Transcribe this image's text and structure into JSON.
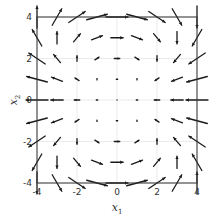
{
  "chart_data": {
    "type": "quiver",
    "title": "",
    "xlabel": "x",
    "xlabel_sub": "1",
    "ylabel": "x",
    "ylabel_sub": "2",
    "xlim": [
      -4,
      4
    ],
    "ylim": [
      -4,
      4
    ],
    "xticks": [
      -4,
      -2,
      0,
      2,
      4
    ],
    "yticks": [
      -4,
      -2,
      0,
      2,
      4
    ],
    "xtick_labels": [
      "-4",
      "-2",
      "0",
      "2",
      "4"
    ],
    "ytick_labels": [
      "-4",
      "-2",
      "0",
      "2",
      "4"
    ],
    "grid": true,
    "grid_points_x": [
      -4,
      -3,
      -2,
      -1,
      0,
      1,
      2,
      3,
      4
    ],
    "grid_points_y": [
      -4,
      -3,
      -2,
      -1,
      0,
      1,
      2,
      3,
      4
    ],
    "field": {
      "u": "x2^2 - x1^2",
      "v": "-x1*x2"
    },
    "arrow_color": "#1a1a1a",
    "grid_color": "#e6e6e6",
    "frame_color": "#333333"
  }
}
